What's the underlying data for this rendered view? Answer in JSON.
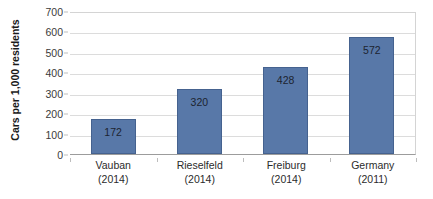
{
  "chart_data": {
    "type": "bar",
    "title": "",
    "subtitle": "",
    "xlabel": "",
    "ylabel": "Cars per 1,000 residents",
    "ylim": [
      0,
      700
    ],
    "yticks": [
      0,
      100,
      200,
      300,
      400,
      500,
      600,
      700
    ],
    "ytick_labels": [
      "0",
      "100",
      "200",
      "300",
      "400",
      "500",
      "600",
      "700"
    ],
    "grid": true,
    "legend": false,
    "legend_position": "none",
    "categories": [
      "Vauban\n(2014)",
      "Rieselfeld\n(2014)",
      "Freiburg\n(2014)",
      "Germany\n(2011)"
    ],
    "category_names": [
      "Vauban",
      "Rieselfeld",
      "Freiburg",
      "Germany"
    ],
    "category_years": [
      "(2014)",
      "(2014)",
      "(2014)",
      "(2011)"
    ],
    "values": [
      172,
      320,
      428,
      572
    ],
    "data_labels": [
      "172",
      "320",
      "428",
      "572"
    ],
    "bars": [
      {
        "name": "Vauban",
        "year": "(2014)",
        "value": 172,
        "label": "172"
      },
      {
        "name": "Rieselfeld",
        "year": "(2014)",
        "value": 320,
        "label": "320"
      },
      {
        "name": "Freiburg",
        "year": "(2014)",
        "value": 428,
        "label": "428"
      },
      {
        "name": "Germany",
        "year": "(2011)",
        "value": 572,
        "label": "572"
      }
    ],
    "colors": {
      "bar_fill": "#5878A8",
      "bar_border": "#45628F",
      "gridline": "#DCDCDC",
      "axis_line": "#9C9C9C",
      "plot_border": "#D4D4D4",
      "background": "#FFFFFF",
      "tick_text": "#3A3A3A",
      "label_text": "#1C2430",
      "axis_title_text": "#1A1A1A"
    }
  }
}
